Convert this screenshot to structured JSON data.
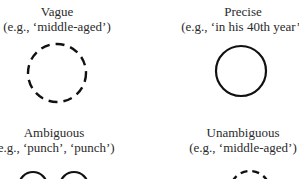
{
  "panels": [
    {
      "title": "Vague",
      "example": "(e.g., ‘middle-aged’)",
      "shape": "dashed-circle",
      "center_x": 57
    },
    {
      "title": "Precise",
      "example": "(e.g., ‘in his 40th year’)",
      "shape": "solid-circle",
      "center_x": 243
    },
    {
      "title": "Ambiguous",
      "example": "(e.g., ‘punch’, ‘punch’)",
      "shape": "two-solid-circles",
      "center_x": 54
    },
    {
      "title": "Unambiguous",
      "example": "(e.g., ‘middle-aged’)",
      "shape": "dashed-circle",
      "center_x": 243
    }
  ],
  "colors": {
    "stroke": "#111111",
    "text": "#2a2a2a",
    "background": "#ffffff"
  }
}
